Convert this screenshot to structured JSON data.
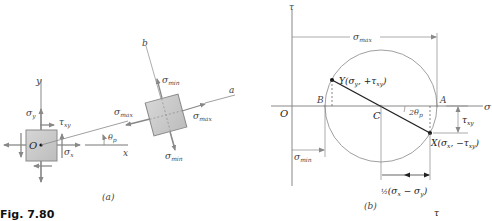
{
  "figure": {
    "caption": "Fig. 7.80",
    "panel_a": {
      "label": "(a)",
      "axes": {
        "x": "x",
        "y": "y",
        "a": "a",
        "b": "b"
      },
      "origin": "O",
      "stresses": {
        "sigma_y": "σ",
        "sigma_y_sub": "y",
        "tau_xy": "τ",
        "tau_xy_sub": "xy",
        "sigma_x": "σ",
        "sigma_x_sub": "x",
        "sigma_max": "σ",
        "sigma_max_sub": "max",
        "sigma_min": "σ",
        "sigma_min_sub": "min"
      },
      "angle": "θ",
      "angle_sub": "p"
    },
    "panel_b": {
      "label": "(b)",
      "axes": {
        "horizontal": "σ",
        "vertical": "τ"
      },
      "origin": "O",
      "points": {
        "B": "B",
        "C": "C",
        "A": "A",
        "Y": "Y(σ",
        "Y_sub1": "y",
        "Y_mid": ", +τ",
        "Y_sub2": "xy",
        "Y_end": ")",
        "X": "X(σ",
        "X_sub1": "x",
        "X_mid": ", −τ",
        "X_sub2": "xy",
        "X_end": ")"
      },
      "dimensions": {
        "sigma_max": "σ",
        "sigma_max_sub": "max",
        "sigma_min": "σ",
        "sigma_min_sub": "min",
        "tau_xy": "τ",
        "tau_xy_sub": "xy",
        "half_diff_frac": "½",
        "half_diff_body": "(σ",
        "half_diff_sub1": "x",
        "half_diff_mid": " − σ",
        "half_diff_sub2": "y",
        "half_diff_end": ")"
      },
      "angle": "2θ",
      "angle_sub": "p"
    },
    "stray_label": "τ"
  },
  "colors": {
    "line": "#888888",
    "dark_line": "#222222",
    "element_fill": "#c8c8c8",
    "element_stroke": "#8a8a8a",
    "circle": "#a0a0a0"
  }
}
